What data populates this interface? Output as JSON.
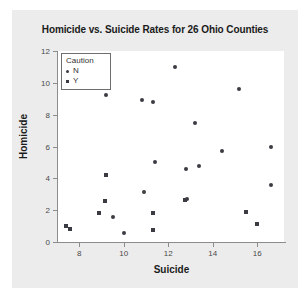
{
  "chart_data": {
    "type": "scatter",
    "title": "Homicide vs. Suicide Rates for 26 Ohio Counties",
    "xlabel": "Suicide",
    "ylabel": "Homicide",
    "xlim": [
      7.0,
      17.2
    ],
    "ylim": [
      0,
      12
    ],
    "xticks": [
      8,
      10,
      12,
      14,
      16
    ],
    "yticks": [
      0,
      2,
      4,
      6,
      8,
      10,
      12
    ],
    "grid": false,
    "legend": {
      "title": "Caution",
      "position": "top-left",
      "entries": [
        {
          "label": "N",
          "marker": "circle"
        },
        {
          "label": "Y",
          "marker": "square"
        }
      ]
    },
    "series": [
      {
        "name": "N",
        "marker": "circle",
        "color": "#3b3b44",
        "points": [
          {
            "x": 9.2,
            "y": 9.25
          },
          {
            "x": 10.8,
            "y": 8.95
          },
          {
            "x": 11.3,
            "y": 8.8
          },
          {
            "x": 12.3,
            "y": 11.0
          },
          {
            "x": 13.2,
            "y": 7.5
          },
          {
            "x": 15.2,
            "y": 9.6
          },
          {
            "x": 14.4,
            "y": 5.7
          },
          {
            "x": 16.6,
            "y": 5.95
          },
          {
            "x": 16.6,
            "y": 3.6
          },
          {
            "x": 11.4,
            "y": 5.0
          },
          {
            "x": 12.8,
            "y": 4.6
          },
          {
            "x": 13.4,
            "y": 4.75
          },
          {
            "x": 10.9,
            "y": 3.15
          },
          {
            "x": 12.85,
            "y": 2.7
          },
          {
            "x": 9.5,
            "y": 1.6
          },
          {
            "x": 10.0,
            "y": 0.55
          }
        ]
      },
      {
        "name": "Y",
        "marker": "square",
        "color": "#3b3b44",
        "points": [
          {
            "x": 7.4,
            "y": 1.0
          },
          {
            "x": 7.6,
            "y": 0.8
          },
          {
            "x": 8.9,
            "y": 1.85
          },
          {
            "x": 9.15,
            "y": 2.6
          },
          {
            "x": 9.2,
            "y": 4.2
          },
          {
            "x": 11.3,
            "y": 1.85
          },
          {
            "x": 11.3,
            "y": 0.75
          },
          {
            "x": 12.75,
            "y": 2.65
          },
          {
            "x": 15.5,
            "y": 1.9
          },
          {
            "x": 16.0,
            "y": 1.1
          }
        ]
      }
    ]
  },
  "figure": {
    "background_color": "#ececec",
    "plot_background_color": "#ffffff",
    "axis_color": "#8c8c8c",
    "marker_color": "#3b3b44"
  }
}
